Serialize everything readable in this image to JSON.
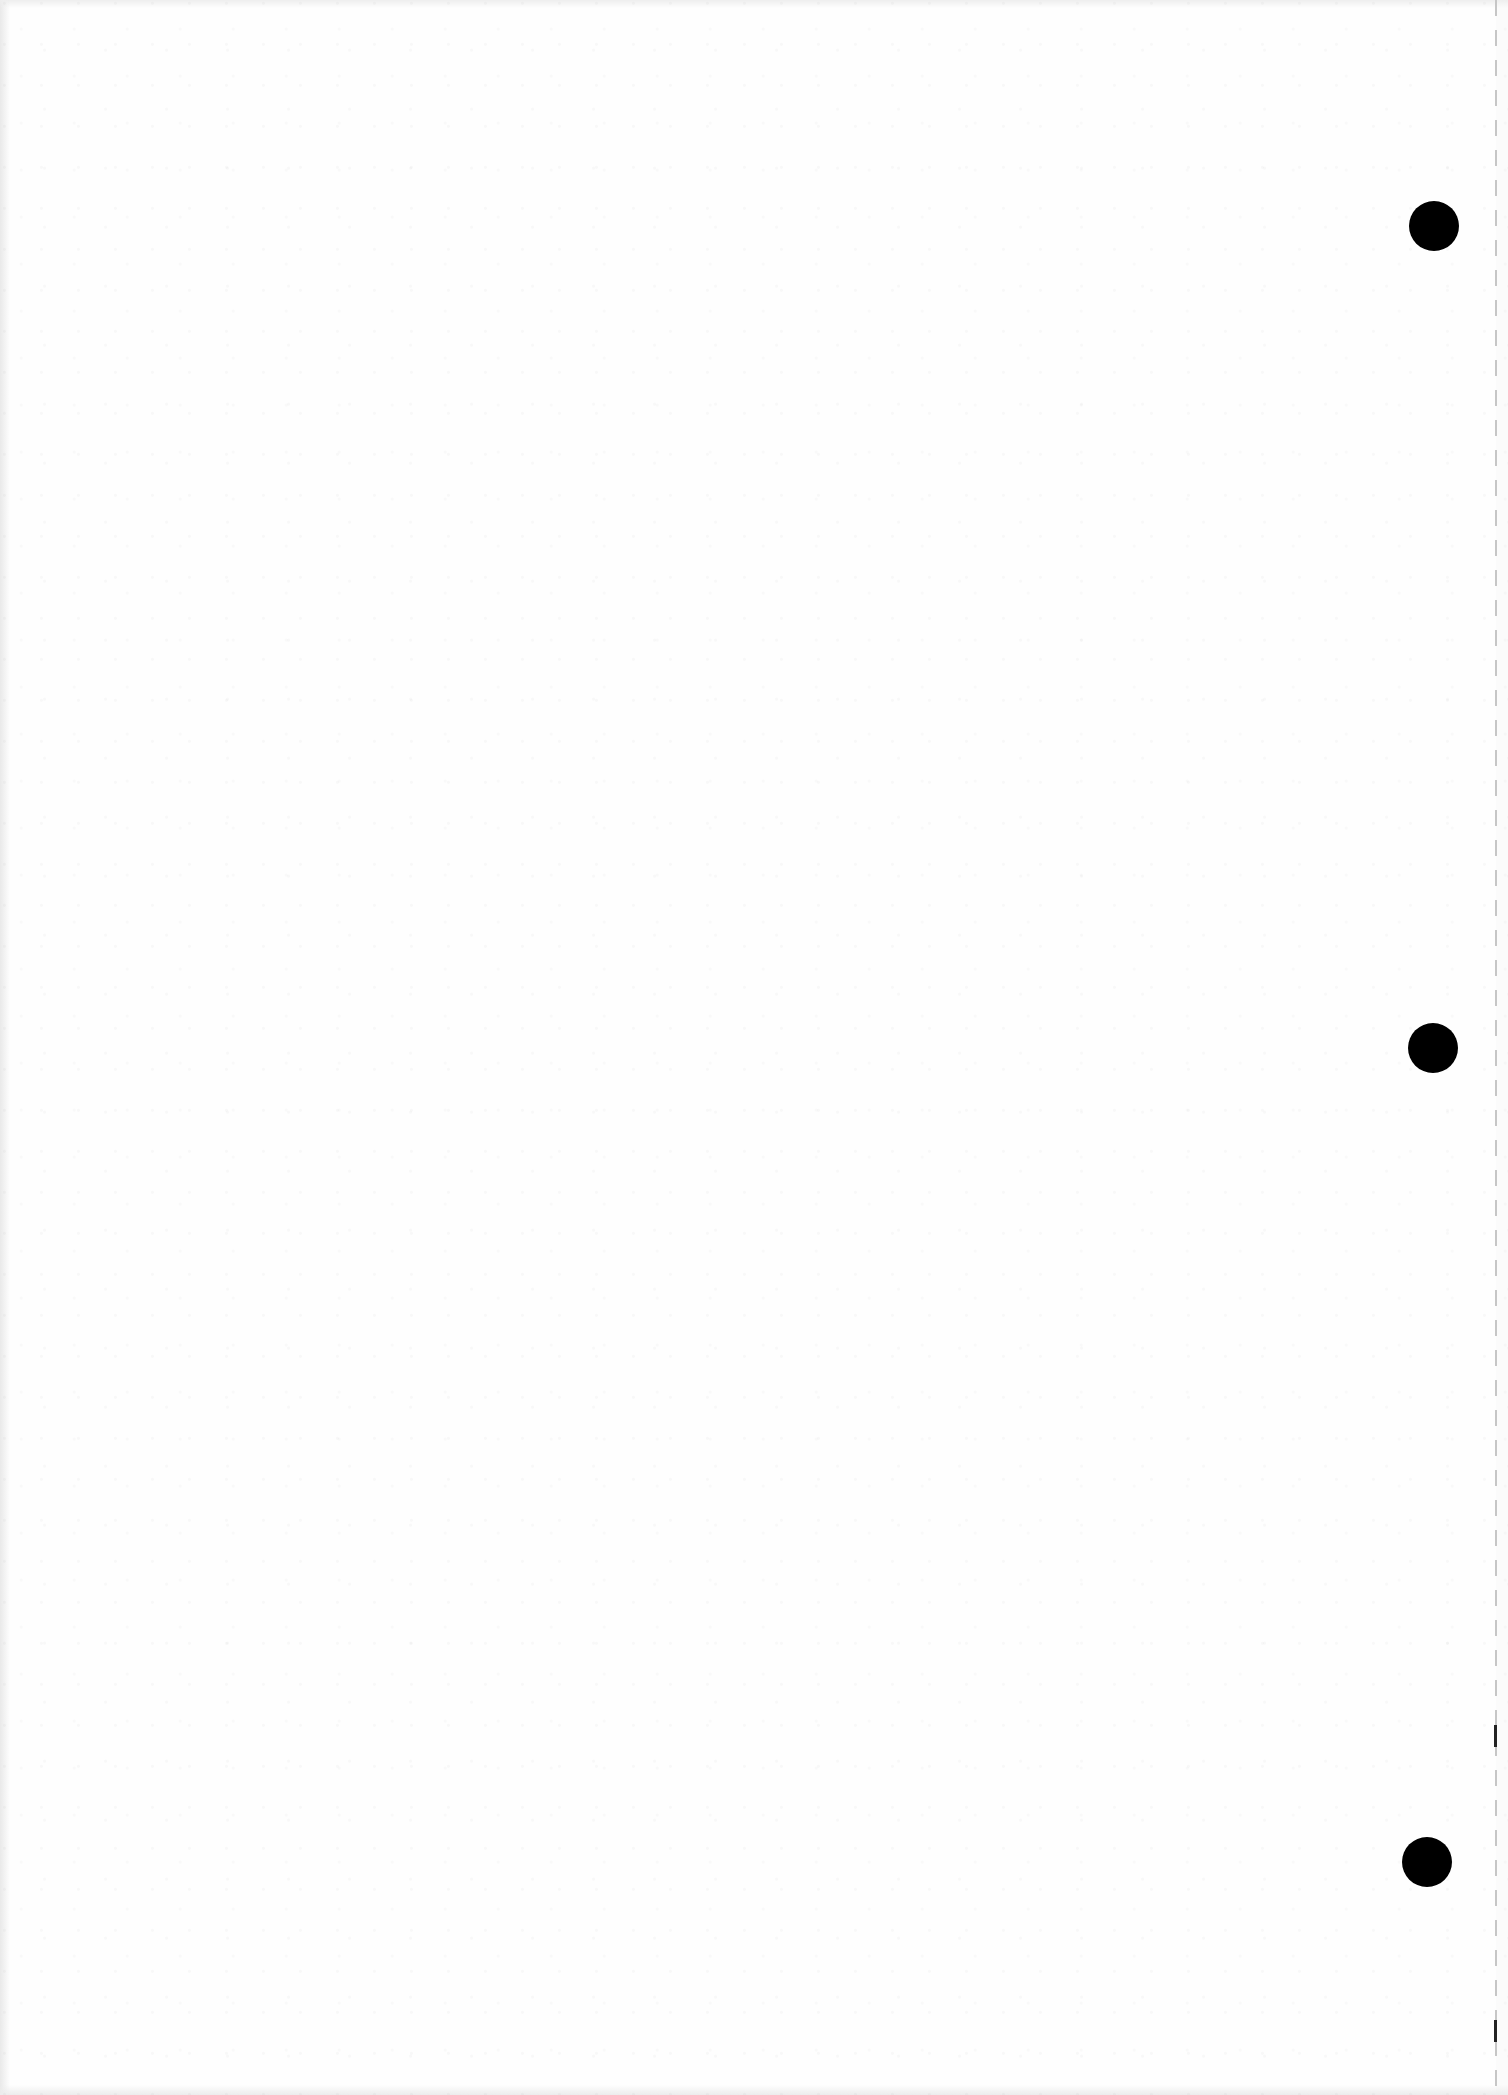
{
  "page": {
    "type": "blank-scanned-sheet",
    "background": "#fefefe",
    "text_content": ""
  },
  "punch_holes": [
    {
      "label": "top-hole",
      "cx": 1434,
      "cy": 226,
      "r": 25,
      "color": "#000000"
    },
    {
      "label": "middle-hole",
      "cx": 1433,
      "cy": 1048,
      "r": 25,
      "color": "#000000"
    },
    {
      "label": "bottom-hole",
      "cx": 1427,
      "cy": 1862,
      "r": 25,
      "color": "#000000"
    }
  ],
  "perforation": {
    "x": 1495,
    "color": "#c6c6c6",
    "marks": [
      {
        "y": 1725,
        "height": 22
      },
      {
        "y": 2020,
        "height": 22
      }
    ]
  }
}
